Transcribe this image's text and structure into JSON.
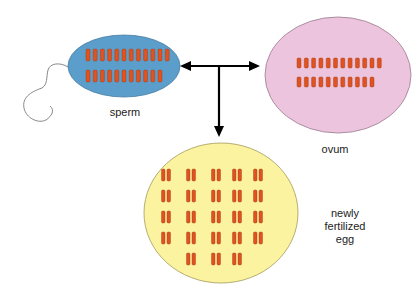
{
  "colors": {
    "sperm_fill": "#5b9ecb",
    "ovum_fill": "#ecc4de",
    "egg_fill": "#fbf3a0",
    "chromosome": "#e0521f",
    "arrow": "#000000"
  },
  "labels": {
    "sperm": "sperm",
    "ovum": "ovum",
    "egg_line1": "newly",
    "egg_line2": "fertilized",
    "egg_line3": "egg"
  },
  "cells": {
    "sperm": {
      "chromosome_rows": [
        12,
        11
      ]
    },
    "ovum": {
      "chromosome_rows": [
        12,
        11
      ]
    },
    "egg": {
      "pair_rows": [
        5,
        5,
        5,
        5,
        3
      ]
    }
  }
}
